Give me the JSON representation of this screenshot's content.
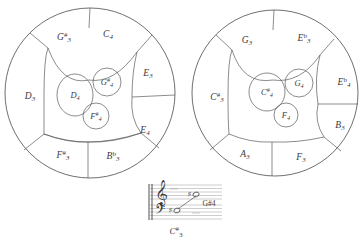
{
  "figure": {
    "type": "voronoi-pitch-circles",
    "circles": [
      {
        "name": "left-circle",
        "cx": 90,
        "cy": 93,
        "r": 85,
        "outer_regions": [
          {
            "id": "D3",
            "base": "D",
            "accidental": "",
            "octave": "3",
            "x": 30,
            "y": 97
          },
          {
            "id": "G#3",
            "base": "G",
            "accidental": "#",
            "octave": "3",
            "x": 64,
            "y": 38
          },
          {
            "id": "C4",
            "base": "C",
            "accidental": "",
            "octave": "4",
            "x": 108,
            "y": 35
          },
          {
            "id": "E3",
            "base": "E",
            "accidental": "",
            "octave": "3",
            "x": 148,
            "y": 74
          },
          {
            "id": "E4",
            "base": "E",
            "accidental": "",
            "octave": "4",
            "x": 145,
            "y": 131
          },
          {
            "id": "Bb3",
            "base": "B",
            "accidental": "b",
            "octave": "3",
            "x": 113,
            "y": 157
          },
          {
            "id": "F#3",
            "base": "F",
            "accidental": "#",
            "octave": "3",
            "x": 63,
            "y": 156
          }
        ],
        "inner_regions": [
          {
            "id": "D4",
            "base": "D",
            "accidental": "",
            "octave": "4",
            "x": 75,
            "y": 95,
            "rx": 18,
            "ry": 21
          },
          {
            "id": "G#4",
            "base": "G",
            "accidental": "#",
            "octave": "4",
            "x": 107,
            "y": 82,
            "rx": 14,
            "ry": 14
          },
          {
            "id": "F#4",
            "base": "F",
            "accidental": "#",
            "octave": "4",
            "x": 96,
            "y": 116,
            "rx": 13,
            "ry": 13
          }
        ]
      },
      {
        "name": "right-circle",
        "cx": 275,
        "cy": 93,
        "r": 83,
        "outer_regions": [
          {
            "id": "C#3",
            "base": "C",
            "accidental": "#",
            "octave": "3",
            "x": 217,
            "y": 98
          },
          {
            "id": "G3",
            "base": "G",
            "accidental": "",
            "octave": "3",
            "x": 247,
            "y": 41
          },
          {
            "id": "Eb3",
            "base": "E",
            "accidental": "b",
            "octave": "3",
            "x": 304,
            "y": 39
          },
          {
            "id": "Eb4",
            "base": "E",
            "accidental": "b",
            "octave": "4",
            "x": 344,
            "y": 83
          },
          {
            "id": "B3",
            "base": "B",
            "accidental": "",
            "octave": "3",
            "x": 340,
            "y": 126
          },
          {
            "id": "F3",
            "base": "F",
            "accidental": "",
            "octave": "3",
            "x": 301,
            "y": 158
          },
          {
            "id": "A3",
            "base": "A",
            "accidental": "",
            "octave": "3",
            "x": 245,
            "y": 155
          }
        ],
        "inner_regions": [
          {
            "id": "C#4",
            "base": "C",
            "accidental": "#",
            "octave": "4",
            "x": 267,
            "y": 92,
            "rx": 18,
            "ry": 19
          },
          {
            "id": "G4",
            "base": "G",
            "accidental": "",
            "octave": "4",
            "x": 299,
            "y": 83,
            "rx": 14,
            "ry": 14
          },
          {
            "id": "F4",
            "base": "F",
            "accidental": "",
            "octave": "4",
            "x": 286,
            "y": 115,
            "rx": 12,
            "ry": 12
          }
        ]
      }
    ]
  },
  "staff": {
    "name": "grand-staff",
    "treble_clef": "𝄞",
    "bass_clef": "𝄢",
    "notes": [
      {
        "id": "bass-note",
        "label_base": "C",
        "label_accidental": "#",
        "label_octave": "3",
        "accidental_glyph": "♯"
      },
      {
        "id": "treble-note",
        "label": "G#4",
        "accidental_glyph": "♯"
      }
    ],
    "caption_low": {
      "base": "C",
      "accidental": "#",
      "octave": "3"
    },
    "caption_high": "G#4"
  },
  "colors": {
    "ink": "#4a4a4a",
    "staff_line": "#9a9a9a",
    "text": "#3a3a3a",
    "background": "#ffffff"
  }
}
